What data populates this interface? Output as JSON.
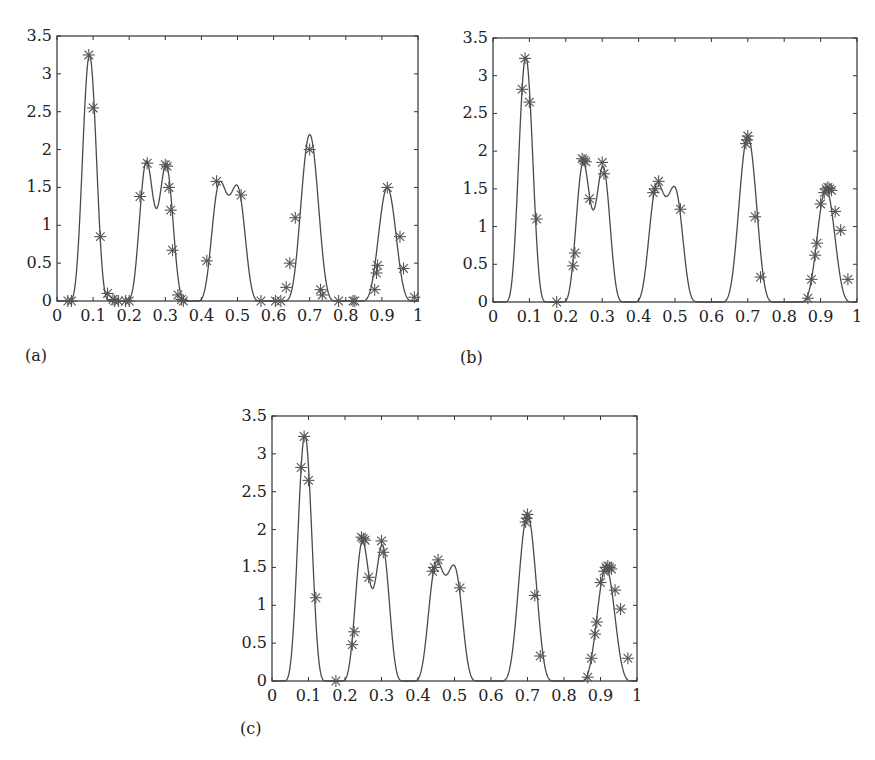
{
  "chart_data": [
    {
      "id": "a",
      "type": "line",
      "panel_label": "(a)",
      "title": "",
      "xlabel": "",
      "ylabel": "",
      "xlim": [
        0,
        1
      ],
      "ylim": [
        0,
        3.5
      ],
      "x_ticks": [
        "0",
        "0.1",
        "0.2",
        "0.3",
        "0.4",
        "0.5",
        "0.6",
        "0.7",
        "0.8",
        "0.9",
        "1"
      ],
      "y_ticks": [
        "0",
        "0.5",
        "1",
        "1.5",
        "2",
        "2.5",
        "3",
        "3.5"
      ],
      "grid": false,
      "legend": null,
      "series": [
        {
          "name": "true function (solid line)",
          "style": "line",
          "peaks": [
            {
              "center": 0.09,
              "height": 3.25,
              "half_width": 0.06
            },
            {
              "center": 0.248,
              "height": 1.85,
              "half_width": 0.06
            },
            {
              "center": 0.302,
              "height": 1.8,
              "half_width": 0.06
            },
            {
              "center": 0.45,
              "height": 1.55,
              "half_width": 0.065
            },
            {
              "center": 0.5,
              "height": 1.5,
              "half_width": 0.065
            },
            {
              "center": 0.7,
              "height": 2.2,
              "half_width": 0.075
            },
            {
              "center": 0.915,
              "height": 1.5,
              "half_width": 0.075
            }
          ]
        },
        {
          "name": "samples (asterisks)",
          "style": "marker-asterisk",
          "points": [
            [
              0.03,
              0
            ],
            [
              0.04,
              0
            ],
            [
              0.088,
              3.25
            ],
            [
              0.1,
              2.55
            ],
            [
              0.12,
              0.85
            ],
            [
              0.14,
              0.1
            ],
            [
              0.155,
              0.02
            ],
            [
              0.16,
              0
            ],
            [
              0.17,
              0
            ],
            [
              0.19,
              0
            ],
            [
              0.2,
              0
            ],
            [
              0.23,
              1.38
            ],
            [
              0.25,
              1.82
            ],
            [
              0.3,
              1.8
            ],
            [
              0.305,
              1.78
            ],
            [
              0.31,
              1.5
            ],
            [
              0.315,
              1.2
            ],
            [
              0.32,
              0.67
            ],
            [
              0.335,
              0.08
            ],
            [
              0.345,
              0.02
            ],
            [
              0.35,
              0
            ],
            [
              0.415,
              0.53
            ],
            [
              0.442,
              1.58
            ],
            [
              0.51,
              1.4
            ],
            [
              0.565,
              0
            ],
            [
              0.605,
              0
            ],
            [
              0.62,
              0
            ],
            [
              0.635,
              0.18
            ],
            [
              0.645,
              0.5
            ],
            [
              0.66,
              1.1
            ],
            [
              0.7,
              2.0
            ],
            [
              0.73,
              0.15
            ],
            [
              0.735,
              0.08
            ],
            [
              0.78,
              0
            ],
            [
              0.82,
              0
            ],
            [
              0.825,
              0
            ],
            [
              0.88,
              0.15
            ],
            [
              0.885,
              0.37
            ],
            [
              0.888,
              0.47
            ],
            [
              0.915,
              1.5
            ],
            [
              0.95,
              0.85
            ],
            [
              0.96,
              0.43
            ],
            [
              0.99,
              0.05
            ]
          ]
        }
      ],
      "frame_px": {
        "left": 57,
        "top": 36,
        "right": 418,
        "bottom": 301
      },
      "label_px": {
        "left": 25,
        "top": 346
      }
    },
    {
      "id": "b",
      "type": "line",
      "panel_label": "(b)",
      "title": "",
      "xlabel": "",
      "ylabel": "",
      "xlim": [
        0,
        1
      ],
      "ylim": [
        0,
        3.5
      ],
      "x_ticks": [
        "0",
        "0.1",
        "0.2",
        "0.3",
        "0.4",
        "0.5",
        "0.6",
        "0.7",
        "0.8",
        "0.9",
        "1"
      ],
      "y_ticks": [
        "0",
        "0.5",
        "1",
        "1.5",
        "2",
        "2.5",
        "3",
        "3.5"
      ],
      "grid": false,
      "legend": null,
      "series": [
        {
          "name": "true function (solid line)",
          "style": "line",
          "peaks": [
            {
              "center": 0.09,
              "height": 3.25,
              "half_width": 0.06
            },
            {
              "center": 0.248,
              "height": 1.85,
              "half_width": 0.06
            },
            {
              "center": 0.302,
              "height": 1.8,
              "half_width": 0.06
            },
            {
              "center": 0.45,
              "height": 1.55,
              "half_width": 0.065
            },
            {
              "center": 0.5,
              "height": 1.5,
              "half_width": 0.065
            },
            {
              "center": 0.7,
              "height": 2.2,
              "half_width": 0.075
            },
            {
              "center": 0.915,
              "height": 1.5,
              "half_width": 0.075
            }
          ]
        },
        {
          "name": "samples (asterisks)",
          "style": "marker-asterisk",
          "points": [
            [
              0.08,
              2.82
            ],
            [
              0.088,
              3.23
            ],
            [
              0.1,
              2.65
            ],
            [
              0.12,
              1.1
            ],
            [
              0.175,
              0
            ],
            [
              0.22,
              0.48
            ],
            [
              0.225,
              0.65
            ],
            [
              0.245,
              1.9
            ],
            [
              0.25,
              1.88
            ],
            [
              0.255,
              1.86
            ],
            [
              0.265,
              1.37
            ],
            [
              0.3,
              1.85
            ],
            [
              0.305,
              1.7
            ],
            [
              0.44,
              1.45
            ],
            [
              0.445,
              1.5
            ],
            [
              0.455,
              1.6
            ],
            [
              0.515,
              1.23
            ],
            [
              0.695,
              2.1
            ],
            [
              0.698,
              2.15
            ],
            [
              0.7,
              2.2
            ],
            [
              0.72,
              1.13
            ],
            [
              0.735,
              0.33
            ],
            [
              0.865,
              0.05
            ],
            [
              0.875,
              0.3
            ],
            [
              0.885,
              0.62
            ],
            [
              0.89,
              0.78
            ],
            [
              0.9,
              1.3
            ],
            [
              0.91,
              1.45
            ],
            [
              0.915,
              1.5
            ],
            [
              0.92,
              1.52
            ],
            [
              0.925,
              1.5
            ],
            [
              0.93,
              1.48
            ],
            [
              0.94,
              1.2
            ],
            [
              0.955,
              0.95
            ],
            [
              0.975,
              0.3
            ]
          ]
        }
      ],
      "frame_px": {
        "left": 493,
        "top": 38,
        "right": 857,
        "bottom": 302
      },
      "label_px": {
        "left": 460,
        "top": 348
      }
    },
    {
      "id": "c",
      "type": "line",
      "panel_label": "(c)",
      "title": "",
      "xlabel": "",
      "ylabel": "",
      "xlim": [
        0,
        1
      ],
      "ylim": [
        0,
        3.5
      ],
      "x_ticks": [
        "0",
        "0.1",
        "0.2",
        "0.3",
        "0.4",
        "0.5",
        "0.6",
        "0.7",
        "0.8",
        "0.9",
        "1"
      ],
      "y_ticks": [
        "0",
        "0.5",
        "1",
        "1.5",
        "2",
        "2.5",
        "3",
        "3.5"
      ],
      "grid": false,
      "legend": null,
      "series": [
        {
          "name": "true function (solid line)",
          "style": "line",
          "peaks": [
            {
              "center": 0.09,
              "height": 3.25,
              "half_width": 0.06
            },
            {
              "center": 0.248,
              "height": 1.85,
              "half_width": 0.06
            },
            {
              "center": 0.302,
              "height": 1.8,
              "half_width": 0.06
            },
            {
              "center": 0.45,
              "height": 1.55,
              "half_width": 0.065
            },
            {
              "center": 0.5,
              "height": 1.5,
              "half_width": 0.065
            },
            {
              "center": 0.7,
              "height": 2.2,
              "half_width": 0.075
            },
            {
              "center": 0.915,
              "height": 1.5,
              "half_width": 0.075
            }
          ]
        },
        {
          "name": "samples (asterisks)",
          "style": "marker-asterisk",
          "points": [
            [
              0.08,
              2.82
            ],
            [
              0.088,
              3.23
            ],
            [
              0.1,
              2.65
            ],
            [
              0.12,
              1.1
            ],
            [
              0.175,
              0
            ],
            [
              0.22,
              0.48
            ],
            [
              0.225,
              0.65
            ],
            [
              0.245,
              1.9
            ],
            [
              0.25,
              1.88
            ],
            [
              0.255,
              1.86
            ],
            [
              0.265,
              1.37
            ],
            [
              0.3,
              1.85
            ],
            [
              0.305,
              1.7
            ],
            [
              0.44,
              1.45
            ],
            [
              0.445,
              1.5
            ],
            [
              0.455,
              1.6
            ],
            [
              0.515,
              1.23
            ],
            [
              0.695,
              2.1
            ],
            [
              0.698,
              2.15
            ],
            [
              0.7,
              2.2
            ],
            [
              0.72,
              1.13
            ],
            [
              0.735,
              0.33
            ],
            [
              0.865,
              0.05
            ],
            [
              0.875,
              0.3
            ],
            [
              0.885,
              0.62
            ],
            [
              0.89,
              0.78
            ],
            [
              0.9,
              1.3
            ],
            [
              0.91,
              1.45
            ],
            [
              0.915,
              1.5
            ],
            [
              0.92,
              1.52
            ],
            [
              0.925,
              1.5
            ],
            [
              0.93,
              1.48
            ],
            [
              0.94,
              1.2
            ],
            [
              0.955,
              0.95
            ],
            [
              0.975,
              0.3
            ]
          ]
        }
      ],
      "frame_px": {
        "left": 272,
        "top": 416,
        "right": 637,
        "bottom": 681
      },
      "label_px": {
        "left": 240,
        "top": 719
      }
    }
  ],
  "colors": {
    "line": "#4a4a4a",
    "marker": "#555555",
    "axis": "#333333",
    "background": "#ffffff"
  }
}
